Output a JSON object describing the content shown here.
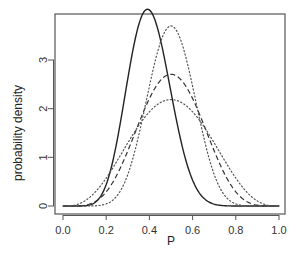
{
  "chart_data": {
    "type": "line",
    "title": "",
    "xlabel": "P",
    "ylabel": "probability density",
    "xlim": [
      0,
      1
    ],
    "ylim": [
      0,
      3.9
    ],
    "x_ticks": [
      "0.0",
      "0.2",
      "0.4",
      "0.6",
      "0.8",
      "1.0"
    ],
    "y_ticks": [
      "0",
      "1",
      "2",
      "3"
    ],
    "grid": false,
    "legend": null,
    "series": [
      {
        "name": "solid",
        "style": "solid",
        "color": "#222222",
        "dist": "beta",
        "alpha": 10,
        "beta": 15,
        "peak": {
          "x": 0.39,
          "y": 3.8
        },
        "x": [
          0.0,
          0.1,
          0.2,
          0.3,
          0.4,
          0.5,
          0.6,
          0.7,
          0.8,
          0.9,
          1.0
        ],
        "y": [
          0.0,
          0.0,
          0.25,
          2.3,
          3.8,
          1.82,
          0.33,
          0.02,
          0.0,
          0.0,
          0.0
        ]
      },
      {
        "name": "dashed",
        "style": "dashed",
        "color": "#333333",
        "dist": "beta",
        "alpha": 6,
        "beta": 6,
        "peak": {
          "x": 0.5,
          "y": 2.71
        },
        "x": [
          0.0,
          0.1,
          0.2,
          0.3,
          0.4,
          0.5,
          0.6,
          0.7,
          0.8,
          0.9,
          1.0
        ],
        "y": [
          0.0,
          0.02,
          0.32,
          1.24,
          2.32,
          2.71,
          2.32,
          1.24,
          0.32,
          0.02,
          0.0
        ]
      },
      {
        "name": "dotted-narrow",
        "style": "dotted",
        "color": "#555555",
        "dist": "beta",
        "alpha": 11,
        "beta": 11,
        "peak": {
          "x": 0.5,
          "y": 3.7
        },
        "x": [
          0.0,
          0.1,
          0.2,
          0.3,
          0.4,
          0.5,
          0.6,
          0.7,
          0.8,
          0.9,
          1.0
        ],
        "y": [
          0.0,
          0.0,
          0.03,
          0.62,
          2.52,
          3.7,
          2.52,
          0.62,
          0.03,
          0.0,
          0.0
        ]
      },
      {
        "name": "dotted-wide",
        "style": "dotted",
        "color": "#555555",
        "dist": "beta",
        "alpha": 4,
        "beta": 4,
        "peak": {
          "x": 0.5,
          "y": 2.19
        },
        "x": [
          0.0,
          0.1,
          0.2,
          0.3,
          0.4,
          0.5,
          0.6,
          0.7,
          0.8,
          0.9,
          1.0
        ],
        "y": [
          0.0,
          0.1,
          0.72,
          1.52,
          2.07,
          2.19,
          2.07,
          1.52,
          0.72,
          0.1,
          0.0
        ]
      }
    ]
  },
  "plot": {
    "frame": {
      "left": 55,
      "top": 14,
      "right": 285,
      "bottom": 214
    },
    "x_map": {
      "x0px": 63,
      "x1px": 279
    },
    "y_map": {
      "y0px": 206,
      "y3px": 60
    }
  }
}
